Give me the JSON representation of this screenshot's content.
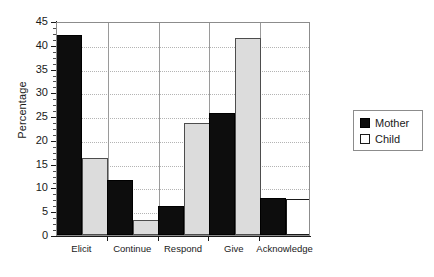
{
  "chart_data": {
    "type": "bar",
    "title": "",
    "subtitle": "",
    "xlabel": "",
    "ylabel": "Percentage",
    "categories": [
      "Elicit",
      "Continue",
      "Respond",
      "Give",
      "Acknowledge"
    ],
    "series": [
      {
        "name": "Mother",
        "color": "#0d0d0d",
        "values": [
          42.0,
          11.5,
          6.2,
          25.6,
          7.8
        ]
      },
      {
        "name": "Child",
        "color": "#dcdcdc",
        "values": [
          16.2,
          3.1,
          23.5,
          41.5,
          7.5
        ]
      }
    ],
    "ylim": [
      0,
      45
    ],
    "ytick_values": [
      0,
      5,
      10,
      15,
      20,
      25,
      30,
      35,
      40,
      45
    ],
    "ytick_labels": [
      "0",
      "5",
      "10",
      "15",
      "20",
      "25",
      "30",
      "35",
      "40",
      "45"
    ],
    "yminor_step": 1.25,
    "grid": true,
    "grid_axis": "y",
    "grid_style": "dotted",
    "legend_position": "right-outside",
    "legend_entries": [
      "Mother",
      "Child"
    ]
  }
}
